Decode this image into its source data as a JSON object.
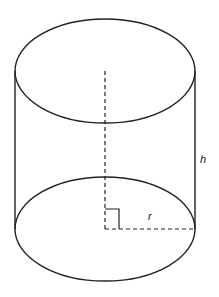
{
  "diagram": {
    "type": "cylinder",
    "labels": {
      "height": "h",
      "radius": "r"
    },
    "colors": {
      "stroke": "#222222",
      "background": "#ffffff"
    },
    "geometry": {
      "center_x": 105,
      "top_center_y": 71,
      "bottom_center_y": 229,
      "radius_x": 90,
      "radius_y": 52
    }
  }
}
